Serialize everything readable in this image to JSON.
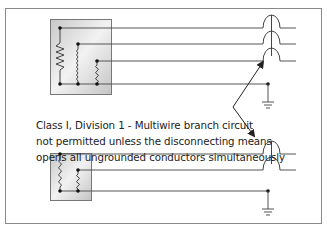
{
  "diagram": {
    "caption_lines": [
      "Class I, Division 1 - Multiwire branch circuit",
      "not permitted unless the disconnecting means",
      "opens all ungrounded conductors simultaneously"
    ],
    "colors": {
      "border": "#8a8a8a",
      "wire": "#555555",
      "box_fill_light": "#f4f4f4",
      "box_fill_dark": "#bdbdbd",
      "arrow": "#222222",
      "text": "#222222"
    },
    "top_circuit": {
      "loads": [
        "resistor-load",
        "inductor-load",
        "small-inductor-load"
      ],
      "ungrounded_conductors": 3,
      "breaker_poles": 3,
      "grounded_conductor": true
    },
    "bottom_circuit": {
      "loads": [
        "inductor-load",
        "inductor-load"
      ],
      "ungrounded_conductors": 2,
      "breaker_poles": 2,
      "grounded_conductor": true
    }
  }
}
